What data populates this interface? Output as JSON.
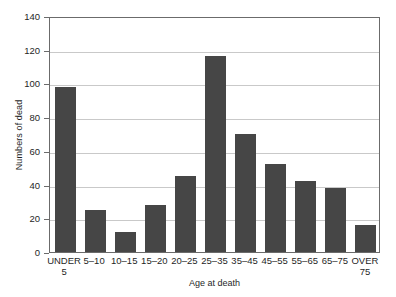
{
  "chart_data": {
    "type": "bar",
    "title": "",
    "xlabel": "Age at death",
    "ylabel": "Numbers of dead",
    "categories": [
      "UNDER\n5",
      "5–10",
      "10–15",
      "15–20",
      "20–25",
      "25–35",
      "35–45",
      "45–55",
      "55–65",
      "65–75",
      "OVER\n75"
    ],
    "values": [
      98,
      25,
      12,
      28,
      45,
      116,
      70,
      52,
      42,
      38,
      16
    ],
    "ylim": [
      0,
      140
    ],
    "ytick_values": [
      0,
      20,
      40,
      60,
      80,
      100,
      120,
      140
    ],
    "ytick_labels": [
      "0",
      "20",
      "40",
      "60",
      "80",
      "100",
      "120",
      "140"
    ],
    "grid": true,
    "legend": null,
    "bar_color": "#464646",
    "grid_color": "#c9c9c9",
    "frame_color": "#6b6b6b"
  }
}
